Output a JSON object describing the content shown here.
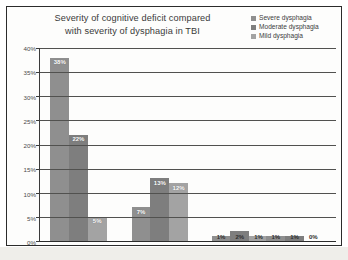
{
  "chart_data": {
    "type": "bar",
    "title": "Severity of cognitive deficit compared with severity of dysphagia in TBI",
    "title_lines": [
      "Severity of cognitive deficit compared",
      "with severity of dysphagia in TBI"
    ],
    "xlabel": "",
    "ylabel": "",
    "ylim": [
      0,
      40
    ],
    "ytick_labels": [
      "0%",
      "5%",
      "10%",
      "15%",
      "20%",
      "25%",
      "30%",
      "35%",
      "40%"
    ],
    "ytick_values": [
      0,
      5,
      10,
      15,
      20,
      25,
      30,
      35,
      40
    ],
    "grid": true,
    "legend_position": "top-right",
    "categories": [
      "",
      "",
      "",
      ""
    ],
    "series": [
      {
        "name": "Severe dysphagia",
        "color": "#8f8f8f",
        "values": [
          38,
          7,
          1,
          1
        ],
        "labels": [
          "38%",
          "7%",
          "1%",
          "1%"
        ]
      },
      {
        "name": "Moderate dysphagia",
        "color": "#7e7e7e",
        "values": [
          22,
          13,
          2,
          1
        ],
        "labels": [
          "22%",
          "13%",
          "2%",
          "1%"
        ]
      },
      {
        "name": "Mild dysphagia",
        "color": "#a3a3a3",
        "values": [
          5,
          12,
          1,
          0
        ],
        "labels": [
          "5%",
          "12%",
          "1%",
          "0%"
        ]
      }
    ]
  },
  "legend": {
    "items": [
      {
        "label": "Severe dysphagia",
        "color": "#8f8f8f"
      },
      {
        "label": "Moderate dysphagia",
        "color": "#7e7e7e"
      },
      {
        "label": "Mild dysphagia",
        "color": "#a3a3a3"
      }
    ]
  },
  "colors": {
    "frame": "#2b2b2b",
    "gridline": "#51514f",
    "text": "#3a3a3a",
    "background": "#fdfdfc"
  }
}
